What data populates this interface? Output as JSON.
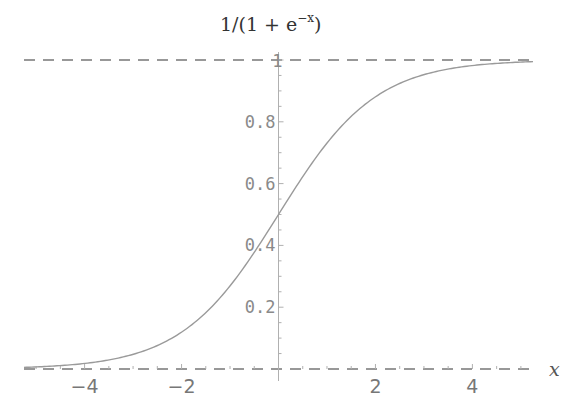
{
  "chart_data": {
    "type": "line",
    "title_parts": {
      "main": "1/(1 + e",
      "superscript": "−x",
      "close": ")"
    },
    "xlabel": "x",
    "ylabel": "",
    "xlim": [
      -5.25,
      5.25
    ],
    "ylim": [
      0,
      1
    ],
    "x_ticks": [
      -4,
      -2,
      2,
      4
    ],
    "x_tick_labels": [
      "−4",
      "−2",
      "2",
      "4"
    ],
    "y_ticks": [
      0.2,
      0.4,
      0.6,
      0.8,
      1
    ],
    "y_tick_labels": [
      "0.2",
      "0.4",
      "0.6",
      "0.8",
      "1"
    ],
    "grid": false,
    "asymptotes": [
      {
        "y": 0,
        "style": "dashed"
      },
      {
        "y": 1,
        "style": "dashed"
      }
    ],
    "series": [
      {
        "name": "sigmoid",
        "function": "1/(1+exp(-x))",
        "x": [
          -5.25,
          -5,
          -4.5,
          -4,
          -3.5,
          -3,
          -2.5,
          -2,
          -1.5,
          -1,
          -0.5,
          0,
          0.5,
          1,
          1.5,
          2,
          2.5,
          3,
          3.5,
          4,
          4.5,
          5,
          5.25
        ],
        "y": [
          0.0052,
          0.0067,
          0.011,
          0.018,
          0.0293,
          0.0474,
          0.0759,
          0.1192,
          0.1824,
          0.2689,
          0.3775,
          0.5,
          0.6225,
          0.7311,
          0.8176,
          0.8808,
          0.9241,
          0.9526,
          0.9707,
          0.982,
          0.989,
          0.9933,
          0.9948
        ],
        "color": "#9a9a9a"
      }
    ],
    "colors": {
      "axis": "#b0b0b0",
      "asymptote": "#777777",
      "curve": "#9a9a9a"
    }
  }
}
